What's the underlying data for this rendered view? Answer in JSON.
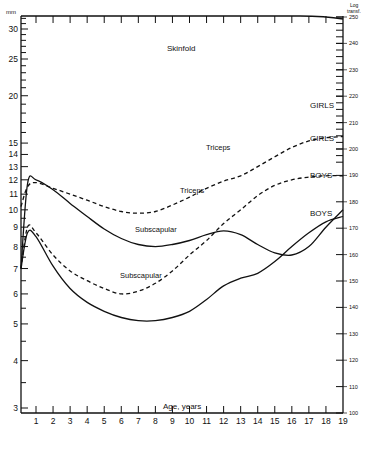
{
  "chart_data": {
    "type": "line",
    "title": "Skinfold",
    "xlabel": "Age, years",
    "ylabel_left": "mm",
    "ylabel_right": "Log transf.",
    "x_ticks": [
      1,
      2,
      3,
      4,
      5,
      6,
      7,
      8,
      9,
      10,
      11,
      12,
      13,
      14,
      15,
      16,
      17,
      18,
      19
    ],
    "y_left_ticks": [
      3,
      4,
      5,
      6,
      7,
      8,
      9,
      10,
      11,
      12,
      13,
      14,
      15,
      20,
      25,
      30
    ],
    "y_right_ticks": [
      100,
      110,
      120,
      130,
      140,
      150,
      160,
      170,
      180,
      190,
      200,
      210,
      220,
      230,
      240,
      250
    ],
    "xlim": [
      0,
      19
    ],
    "ylim_left": [
      2.9,
      32
    ],
    "ylim_right": [
      100,
      250
    ],
    "grid": false,
    "legend_position": "inline labels at right",
    "series": [
      {
        "name": "Triceps GIRLS",
        "style": "dashed",
        "label": "GIRLS",
        "curve_label": "Triceps",
        "x": [
          0.1,
          0.5,
          1,
          2,
          3,
          4,
          5,
          6,
          7,
          8,
          9,
          10,
          11,
          12,
          13,
          14,
          15,
          16,
          17,
          18,
          19
        ],
        "values": [
          10.2,
          11.5,
          11.8,
          11.4,
          11.0,
          10.6,
          10.2,
          9.9,
          9.8,
          9.9,
          10.3,
          10.8,
          11.4,
          11.9,
          12.3,
          13.0,
          13.8,
          14.6,
          15.2,
          15.5,
          15.6
        ]
      },
      {
        "name": "Subscapular GIRLS",
        "style": "dashed",
        "label": "GIRLS",
        "curve_label": "Subscapular",
        "x": [
          0.1,
          0.5,
          1,
          2,
          3,
          4,
          5,
          6,
          7,
          8,
          9,
          10,
          11,
          12,
          13,
          14,
          15,
          16,
          17,
          18,
          19
        ],
        "values": [
          7.0,
          9.0,
          8.7,
          7.6,
          6.9,
          6.5,
          6.2,
          6.0,
          6.1,
          6.4,
          6.9,
          7.6,
          8.3,
          9.2,
          10.0,
          10.9,
          11.6,
          12.0,
          12.2,
          12.3,
          12.3
        ]
      },
      {
        "name": "Triceps BOYS",
        "style": "solid",
        "label": "BOYS",
        "curve_label": "Triceps",
        "x": [
          0.1,
          0.5,
          1,
          2,
          3,
          4,
          5,
          6,
          7,
          8,
          9,
          10,
          11,
          12,
          13,
          14,
          15,
          16,
          17,
          18,
          19
        ],
        "values": [
          7.0,
          11.7,
          12.0,
          11.3,
          10.4,
          9.6,
          8.9,
          8.4,
          8.1,
          8.0,
          8.1,
          8.3,
          8.6,
          8.8,
          8.6,
          8.1,
          7.7,
          7.6,
          8.0,
          9.0,
          10.0
        ]
      },
      {
        "name": "Subscapular BOYS",
        "style": "solid",
        "label": "BOYS",
        "curve_label": "Subscapular",
        "x": [
          0.1,
          0.5,
          1,
          2,
          3,
          4,
          5,
          6,
          7,
          8,
          9,
          10,
          11,
          12,
          13,
          14,
          15,
          16,
          17,
          18,
          19
        ],
        "values": [
          7.0,
          8.7,
          8.5,
          7.1,
          6.2,
          5.7,
          5.4,
          5.2,
          5.1,
          5.1,
          5.2,
          5.4,
          5.8,
          6.3,
          6.6,
          6.8,
          7.3,
          8.0,
          8.7,
          9.3,
          9.6
        ]
      }
    ]
  },
  "labels": {
    "mm": "mm",
    "log1": "Log",
    "log2": "transf.",
    "title": "Skinfold",
    "xlabel": "Age, years",
    "triceps_girls": "Triceps",
    "triceps_boys": "Triceps",
    "subscap_girls": "Subscapular",
    "subscap_boys": "Subscapular",
    "girls1": "GIRLS",
    "girls2": "GIRLS",
    "boys1": "BOYS",
    "boys2": "BOYS"
  }
}
